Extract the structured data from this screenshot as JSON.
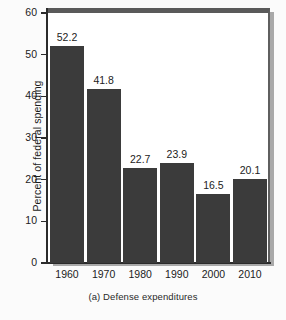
{
  "chart_data": {
    "type": "bar",
    "title": "",
    "caption": "(a) Defense expenditures",
    "xlabel": "",
    "ylabel": "Percent of federal spending",
    "categories": [
      "1960",
      "1970",
      "1980",
      "1990",
      "2000",
      "2010"
    ],
    "values": [
      52.2,
      41.8,
      22.7,
      23.9,
      16.5,
      20.1
    ],
    "value_labels": [
      "52.2",
      "41.8",
      "22.7",
      "23.9",
      "16.5",
      "20.1"
    ],
    "ylim": [
      0,
      60
    ],
    "yticks": [
      0,
      10,
      20,
      30,
      40,
      50,
      60
    ],
    "ytick_labels": [
      "0",
      "10",
      "20",
      "30",
      "40",
      "50",
      "60"
    ],
    "grid": false,
    "legend": null,
    "bar_color": "#3b3b3b",
    "plot_background": "#ffffff",
    "frame_color": "#5a5a5a",
    "text_color": "#1c1c1c"
  }
}
